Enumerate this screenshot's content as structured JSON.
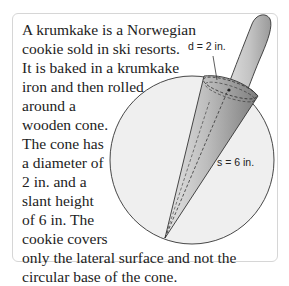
{
  "problem": {
    "lines": [
      "A krumkake is a Norwegian",
      "cookie sold in ski resorts.",
      "It is baked in a krumkake",
      "iron and then rolled",
      "around a",
      "wooden cone.",
      "The cone has",
      "a diameter of",
      "2 in. and a",
      "slant height",
      "of 6 in. The",
      "cookie covers",
      "only the lateral surface and not the",
      "circular base of the cone."
    ]
  },
  "figure": {
    "diameter_label": "d = 2 in.",
    "slant_label": "s = 6 in."
  }
}
